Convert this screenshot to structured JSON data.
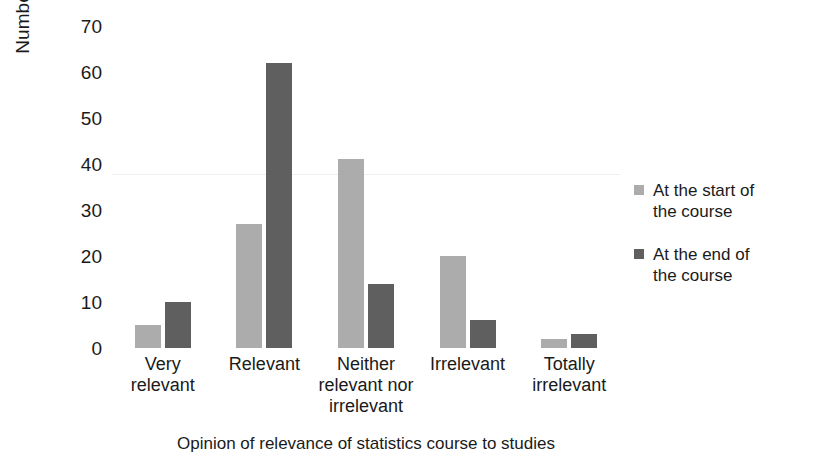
{
  "chart_data": {
    "type": "bar",
    "title": "",
    "xlabel": "Opinion of relevance of statistics course to studies",
    "ylabel": "Number of students",
    "categories": [
      "Very relevant",
      "Relevant",
      "Neither relevant nor irrelevant",
      "Irrelevant",
      "Totally irrelevant"
    ],
    "category_lines": [
      [
        "Very",
        "relevant"
      ],
      [
        "Relevant"
      ],
      [
        "Neither",
        "relevant nor",
        "irrelevant"
      ],
      [
        "Irrelevant"
      ],
      [
        "Totally",
        "irrelevant"
      ]
    ],
    "series": [
      {
        "name": "At the start of the course",
        "name_lines": [
          "At the start of",
          "the course"
        ],
        "color": "#acacac",
        "values": [
          5,
          27,
          41,
          20,
          2
        ]
      },
      {
        "name": "At the end of the course",
        "name_lines": [
          "At the end of",
          "the course"
        ],
        "color": "#5f5f5f",
        "values": [
          10,
          62,
          14,
          6,
          3
        ]
      }
    ],
    "ylim": [
      0,
      70
    ],
    "yticks": [
      0,
      10,
      20,
      30,
      40,
      50,
      60,
      70
    ],
    "ytick_labels": [
      "0",
      "10",
      "20",
      "30",
      "40",
      "50",
      "60",
      "70"
    ],
    "grid": "horizontal-faint",
    "gridline_values": [
      50
    ],
    "legend_position": "right"
  },
  "ylabels": {
    "t0": "0",
    "t10": "10",
    "t20": "20",
    "t30": "30",
    "t40": "40",
    "t50": "50",
    "t60": "60",
    "t70": "70"
  },
  "xticks": {
    "c0l0": "Very",
    "c0l1": "relevant",
    "c1l0": "Relevant",
    "c2l0": "Neither",
    "c2l1": "relevant nor",
    "c2l2": "irrelevant",
    "c3l0": "Irrelevant",
    "c4l0": "Totally",
    "c4l1": "irrelevant"
  },
  "legend": {
    "s0l0": "At the start of",
    "s0l1": "the course",
    "s1l0": "At the end of",
    "s1l1": "the course"
  }
}
